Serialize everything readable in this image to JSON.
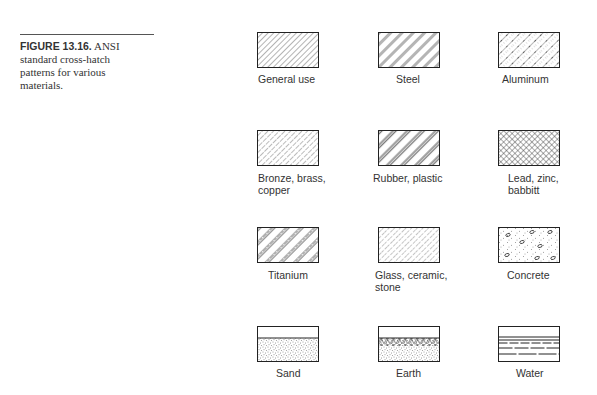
{
  "caption": {
    "figure_label": "FIGURE 13.16.",
    "text_line1": "ANSI",
    "text_line2": "standard cross-hatch",
    "text_line3": "patterns for various",
    "text_line4": "materials."
  },
  "materials": [
    {
      "label": "General use",
      "pattern": "thin-diagonal-hatch"
    },
    {
      "label": "Steel",
      "pattern": "double-diagonal-hatch"
    },
    {
      "label": "Aluminum",
      "pattern": "diagonal-with-dots-crosshatch"
    },
    {
      "label_line1": "Bronze, brass,",
      "label_line2": "copper",
      "pattern": "dashed-diagonal-hatch"
    },
    {
      "label": "Rubber, plastic",
      "pattern": "triple-diagonal-hatch"
    },
    {
      "label_line1": "Lead, zinc,",
      "label_line2": "babbitt",
      "pattern": "dense-crosshatch"
    },
    {
      "label": "Titanium",
      "pattern": "grouped-diagonal-hatch"
    },
    {
      "label_line1": "Glass, ceramic,",
      "label_line2": "stone",
      "pattern": "broken-diagonal-hatch"
    },
    {
      "label": "Concrete",
      "pattern": "stipple-with-aggregate"
    },
    {
      "label": "Sand",
      "pattern": "stipple-below-surface-line"
    },
    {
      "label": "Earth",
      "pattern": "herringbone-over-stipple"
    },
    {
      "label": "Water",
      "pattern": "horizontal-dashed-lines"
    }
  ]
}
